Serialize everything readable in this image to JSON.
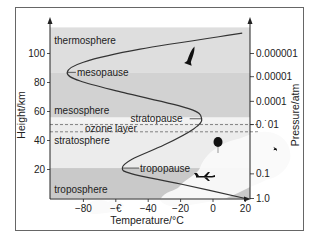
{
  "chart_data": {
    "type": "line",
    "title": "",
    "xlabel": "Temperature/°C",
    "ylabel": "Height/km",
    "y2label": "Pressure/atm",
    "xlim": [
      -100,
      20
    ],
    "ylim": [
      0,
      118
    ],
    "x_ticks": [
      -80,
      -60,
      -40,
      -20,
      0,
      20
    ],
    "x_tick_labels": [
      "−80",
      "−€",
      "−40",
      "−20",
      "0",
      "20"
    ],
    "y_ticks": [
      20,
      40,
      60,
      80,
      100
    ],
    "y_tick_labels": [
      "20",
      "40",
      "60",
      "80",
      "100"
    ],
    "y2_ticks": [
      {
        "height_km": 100,
        "label": "0.000001"
      },
      {
        "height_km": 84,
        "label": "0.00001"
      },
      {
        "height_km": 67,
        "label": "0.0001"
      },
      {
        "height_km": 51,
        "label": "0.˙01"
      },
      {
        "height_km": 17,
        "label": "0.1"
      },
      {
        "height_km": 0,
        "label": "1.0"
      }
    ],
    "grid": false,
    "series": [
      {
        "name": "temperature profile",
        "points": [
          {
            "temp": 20,
            "height": 0
          },
          {
            "temp": -20,
            "height": 10
          },
          {
            "temp": -50,
            "height": 17
          },
          {
            "temp": -56,
            "height": 21
          },
          {
            "temp": -50,
            "height": 27
          },
          {
            "temp": -30,
            "height": 37
          },
          {
            "temp": -12,
            "height": 48
          },
          {
            "temp": -7,
            "height": 55
          },
          {
            "temp": -15,
            "height": 62
          },
          {
            "temp": -55,
            "height": 73
          },
          {
            "temp": -82,
            "height": 81
          },
          {
            "temp": -90,
            "height": 87
          },
          {
            "temp": -80,
            "height": 94
          },
          {
            "temp": -45,
            "height": 103
          },
          {
            "temp": 18,
            "height": 114
          }
        ]
      }
    ],
    "bands": [
      {
        "name": "troposphere",
        "from": 0,
        "to": 21,
        "color": "#c9c9c9"
      },
      {
        "name": "stratosphere",
        "from": 21,
        "to": 52,
        "color": "#ececec"
      },
      {
        "name": "stratopause-band",
        "from": 52,
        "to": 56,
        "color": "#f3f3f3"
      },
      {
        "name": "mesosphere",
        "from": 56,
        "to": 87,
        "color": "#d2d2d2"
      },
      {
        "name": "thermosphere",
        "from": 87,
        "to": 118,
        "color": "#dedede"
      }
    ],
    "ozone_layer": {
      "from": 46,
      "to": 51,
      "label": "ozone layer"
    },
    "annotations": [
      {
        "text": "thermosphere",
        "temp": -98,
        "height": 109,
        "kind": "region"
      },
      {
        "text": "mesopause",
        "temp": -84,
        "height": 87,
        "kind": "pointer",
        "anchor_temp": -90
      },
      {
        "text": "mesosphere",
        "temp": -98,
        "height": 61,
        "kind": "region"
      },
      {
        "text": "stratopause",
        "temp": -51,
        "height": 55,
        "kind": "pointer",
        "anchor_temp": -7
      },
      {
        "text": "ozone layer",
        "temp": -79,
        "height": 48,
        "kind": "label"
      },
      {
        "text": "stratosphere",
        "temp": -98,
        "height": 40,
        "kind": "region"
      },
      {
        "text": "tropopause",
        "temp": -45,
        "height": 21,
        "kind": "pointer",
        "anchor_temp": -56
      },
      {
        "text": "troposphere",
        "temp": -98,
        "height": 6,
        "kind": "region"
      }
    ]
  },
  "colors": {
    "curve": "#333333",
    "axis": "#222222",
    "frame": "#666666",
    "text": "#222222"
  },
  "icons": [
    "rocket-icon",
    "balloon-icon",
    "airplane-icon",
    "bird-icon",
    "cloud-icon"
  ]
}
